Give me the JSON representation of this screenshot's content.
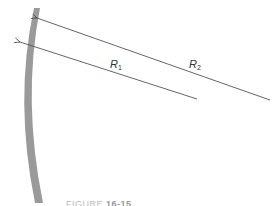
{
  "diagram": {
    "mirror": {
      "color": "#9a9a9a",
      "description": "curved mirror surface"
    },
    "rays": [
      {
        "id": "R1",
        "symbol": "R",
        "subscript": "1",
        "from": [
          197,
          99
        ],
        "to": [
          20,
          42
        ],
        "color": "#555555"
      },
      {
        "id": "R2",
        "symbol": "R",
        "subscript": "2",
        "from": [
          270,
          100
        ],
        "to": [
          36,
          18
        ],
        "color": "#555555"
      }
    ],
    "labels": {
      "r1": {
        "symbol": "R",
        "subscript": "1"
      },
      "r2": {
        "symbol": "R",
        "subscript": "2"
      }
    },
    "caption": {
      "prefix": "FIGURE",
      "number": "16-15"
    }
  }
}
